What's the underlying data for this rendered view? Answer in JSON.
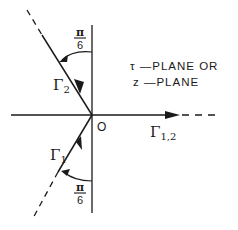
{
  "diagram": {
    "title_line1": "τ —PLANE OR",
    "title_line2": "z —PLANE",
    "origin_label": "O",
    "contours": {
      "gamma_1": {
        "symbol": "Γ",
        "subscript": "1"
      },
      "gamma_2": {
        "symbol": "Γ",
        "subscript": "2"
      },
      "gamma_12": {
        "symbol": "Γ",
        "subscript": "1,2"
      }
    },
    "angles": {
      "upper": {
        "numerator": "π",
        "denominator": "6"
      },
      "lower": {
        "numerator": "π",
        "denominator": "6"
      }
    },
    "colors": {
      "ink": "#1a1a1a",
      "background": "#ffffff"
    }
  }
}
